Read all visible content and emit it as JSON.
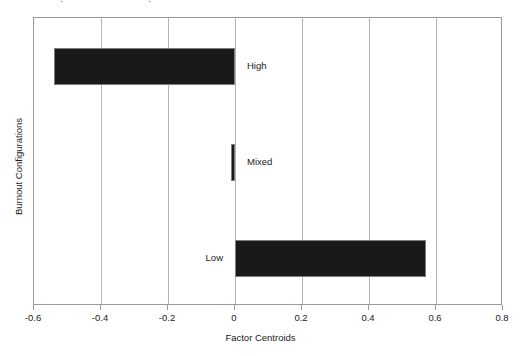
{
  "figure": {
    "background_color": "#ffffff",
    "bar_color": "#191919",
    "bar_edge_color": "#7d7d7d",
    "grid_color": "#b4b4b4",
    "frame_color": "#9a9a9a",
    "top_remnant_left": "·",
    "top_remnant_right": "·"
  },
  "chart_data": {
    "type": "bar",
    "orientation": "horizontal",
    "title": "",
    "xlabel": "Factor Centroids",
    "ylabel": "Burnout Configurations",
    "categories": [
      "High",
      "Mixed",
      "Low"
    ],
    "values": [
      -0.54,
      -0.012,
      0.57
    ],
    "xlim": [
      -0.6,
      0.8
    ],
    "xticks": [
      -0.6,
      -0.4,
      -0.2,
      0,
      0.2,
      0.4,
      0.6,
      0.8
    ],
    "xticklabels": [
      "-0.6",
      "-0.4",
      "-0.2",
      "0",
      "0.2",
      "0.4",
      "0.6",
      "0.8"
    ],
    "yticks": [],
    "yticklabels": [],
    "grid": true,
    "grid_axis": "x",
    "legend": false,
    "bar_labels": [
      {
        "text": "High",
        "value": -0.54,
        "side": "right"
      },
      {
        "text": "Mixed",
        "value": -0.012,
        "side": "right"
      },
      {
        "text": "Low",
        "value": 0.57,
        "side": "left"
      }
    ]
  }
}
